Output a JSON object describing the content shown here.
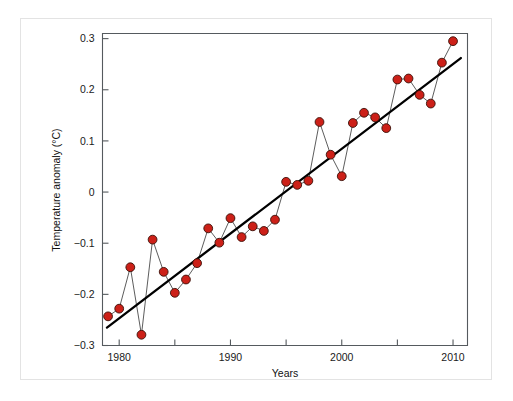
{
  "chart_data": {
    "type": "line",
    "title": "",
    "subtitle": "",
    "xlabel": "Years",
    "ylabel": "Temperature anomaly (°C)",
    "xlim": [
      1978.5,
      2011.3
    ],
    "ylim": [
      -0.3,
      0.31
    ],
    "grid": false,
    "legend": "none",
    "x_ticks": [
      1980,
      1985,
      1990,
      1995,
      2000,
      2005,
      2010
    ],
    "x_tick_labels": [
      "1980",
      "",
      "1990",
      "",
      "2000",
      "",
      "2010"
    ],
    "y_ticks": [
      -0.3,
      -0.2,
      -0.1,
      0,
      0.1,
      0.2,
      0.3
    ],
    "y_tick_labels": [
      "-0.3",
      "-0.2",
      "-0.1",
      "0",
      "0.1",
      "0.2",
      "0.3"
    ],
    "marker_color": "#cc2018",
    "marker_edge_color": "#3a1008",
    "series_line_color": "#4a4a4a",
    "trend_line_color": "#000000",
    "x": [
      1979,
      1980,
      1981,
      1982,
      1983,
      1984,
      1985,
      1986,
      1987,
      1988,
      1989,
      1990,
      1991,
      1992,
      1993,
      1994,
      1995,
      1996,
      1997,
      1998,
      1999,
      2000,
      2001,
      2002,
      2003,
      2004,
      2005,
      2006,
      2007,
      2008,
      2009,
      2010
    ],
    "values": [
      -0.243,
      -0.228,
      -0.147,
      -0.279,
      -0.093,
      -0.156,
      -0.197,
      -0.171,
      -0.139,
      -0.071,
      -0.099,
      -0.051,
      -0.088,
      -0.067,
      -0.076,
      -0.054,
      0.02,
      0.014,
      0.022,
      0.137,
      0.073,
      0.031,
      0.135,
      0.155,
      0.146,
      0.125,
      0.22,
      0.222,
      0.19,
      0.173,
      0.253,
      0.295
    ],
    "series": [
      {
        "name": "Temperature anomaly",
        "values": [
          -0.243,
          -0.228,
          -0.147,
          -0.279,
          -0.093,
          -0.156,
          -0.197,
          -0.171,
          -0.139,
          -0.071,
          -0.099,
          -0.051,
          -0.088,
          -0.067,
          -0.076,
          -0.054,
          0.02,
          0.014,
          0.022,
          0.137,
          0.073,
          0.031,
          0.135,
          0.155,
          0.146,
          0.125,
          0.22,
          0.222,
          0.19,
          0.173,
          0.253,
          0.295
        ]
      }
    ],
    "trend": {
      "name": "Linear trend",
      "x_start": 1978.9,
      "y_start": -0.265,
      "x_end": 2010.7,
      "y_end": 0.262
    },
    "annotations": []
  }
}
